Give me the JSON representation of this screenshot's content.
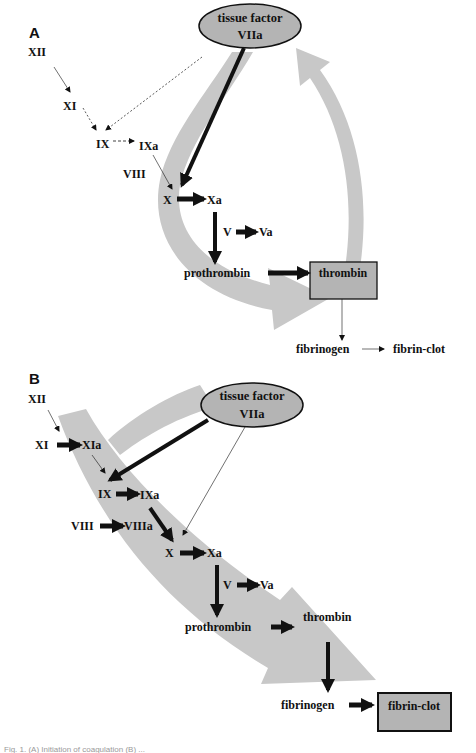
{
  "colors": {
    "band": "#c8c8c8",
    "node_fill": "#b4b4b4",
    "ink": "#111111",
    "background": "#ffffff"
  },
  "panel_a": {
    "label": "A",
    "tissue_factor": {
      "line1": "tissue factor",
      "line2": "VIIa"
    },
    "nodes": {
      "xii": "XII",
      "xi": "XI",
      "ix": "IX",
      "ixa": "IXa",
      "viii": "VIII",
      "x": "X",
      "xa": "Xa",
      "v": "V",
      "va": "Va",
      "prothrombin": "prothrombin",
      "thrombin": "thrombin",
      "fibrinogen": "fibrinogen",
      "fibrin_clot": "fibrin-clot"
    }
  },
  "panel_b": {
    "label": "B",
    "tissue_factor": {
      "line1": "tissue factor",
      "line2": "VIIa"
    },
    "nodes": {
      "xii": "XII",
      "xi": "XI",
      "xia": "XIa",
      "ix": "IX",
      "ixa": "IXa",
      "viii": "VIII",
      "viiia": "VIIIa",
      "x": "X",
      "xa": "Xa",
      "v": "V",
      "va": "Va",
      "prothrombin": "prothrombin",
      "thrombin": "thrombin",
      "fibrinogen": "fibrinogen",
      "fibrin_clot": "fibrin-clot"
    }
  },
  "caption": "Fig. 1. (A) Initiation of coagulation (B) ..."
}
